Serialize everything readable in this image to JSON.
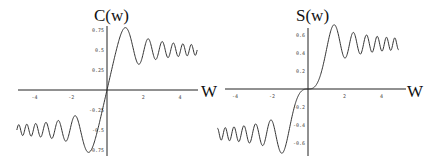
{
  "chart_data": [
    {
      "type": "line",
      "title": "C(w)",
      "xlabel": "W",
      "ylabel": "",
      "xlim": [
        -5,
        5
      ],
      "ylim": [
        -0.8,
        0.8
      ],
      "xticks": [
        "-4",
        "-2",
        "2",
        "4"
      ],
      "yticks": [
        "0.75",
        "0.5",
        "0.25",
        "-0.25",
        "-0.5",
        "-0.75"
      ],
      "grid": false,
      "function": "Fresnel cosine integral C(w) = ∫0^w cos(πt²/2) dt",
      "series": [
        {
          "name": "C(w)",
          "x": [
            -5,
            -4,
            -3,
            -2,
            -1.5,
            -1,
            -0.5,
            0,
            0.5,
            1,
            1.5,
            2,
            3,
            4,
            5
          ],
          "y": [
            -0.56,
            -0.5,
            -0.61,
            -0.49,
            -0.45,
            -0.78,
            -0.49,
            0,
            0.49,
            0.78,
            0.45,
            0.49,
            0.61,
            0.5,
            0.56
          ]
        }
      ]
    },
    {
      "type": "line",
      "title": "S(w)",
      "xlabel": "W",
      "ylabel": "",
      "xlim": [
        -5,
        5
      ],
      "ylim": [
        -0.75,
        0.75
      ],
      "xticks": [
        "-4",
        "-2",
        "2",
        "4"
      ],
      "yticks": [
        "0.6",
        "0.4",
        "0.2",
        "-0.2",
        "-0.4",
        "-0.6"
      ],
      "grid": false,
      "function": "Fresnel sine integral S(w) = ∫0^w sin(πt²/2) dt",
      "series": [
        {
          "name": "S(w)",
          "x": [
            -5,
            -4,
            -3,
            -2,
            -1.5,
            -1,
            -0.5,
            0,
            0.5,
            1,
            1.5,
            2,
            3,
            4,
            5
          ],
          "y": [
            -0.5,
            -0.42,
            -0.5,
            -0.34,
            -0.7,
            -0.44,
            -0.06,
            0,
            0.06,
            0.44,
            0.7,
            0.34,
            0.5,
            0.42,
            0.5
          ]
        }
      ]
    }
  ]
}
